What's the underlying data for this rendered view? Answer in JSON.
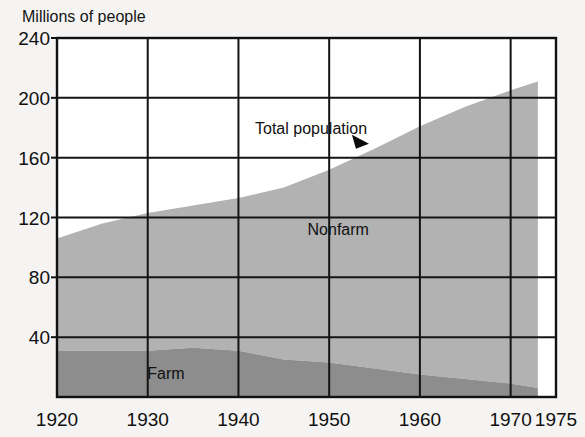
{
  "chart_data": {
    "type": "area",
    "stacked": true,
    "title": "",
    "subtitle": "",
    "ylabel": "Millions of people",
    "xlabel": "",
    "grid": true,
    "legend_position": "inline-annotation",
    "xlim": [
      1920,
      1975
    ],
    "ylim": [
      0,
      240
    ],
    "x_ticks": [
      1920,
      1930,
      1940,
      1950,
      1960,
      1970,
      1975
    ],
    "x_tick_labels": [
      "1920",
      "1930",
      "1940",
      "1950",
      "1960",
      "1970",
      "1975"
    ],
    "y_ticks": [
      40,
      80,
      120,
      160,
      200,
      240
    ],
    "y_tick_labels": [
      "40",
      "80",
      "120",
      "160",
      "200",
      "240"
    ],
    "data_end_year": 1973,
    "x": [
      1920,
      1925,
      1930,
      1935,
      1940,
      1945,
      1950,
      1955,
      1960,
      1965,
      1970,
      1973
    ],
    "series": [
      {
        "name": "Farm",
        "color": "#8d8d8d",
        "label": "Farm",
        "label_x": 1932,
        "label_y": 12,
        "values": [
          31,
          31,
          31,
          33,
          31,
          25,
          23,
          19,
          15,
          12,
          9,
          6
        ]
      },
      {
        "name": "Nonfarm",
        "color": "#b2b2b2",
        "label": "Nonfarm",
        "label_x": 1951,
        "label_y": 108,
        "values": [
          75,
          85,
          92,
          95,
          102,
          115,
          129,
          147,
          166,
          182,
          196,
          205
        ]
      }
    ],
    "totals": [
      106,
      116,
      123,
      128,
      133,
      140,
      152,
      166,
      181,
      194,
      205,
      211
    ],
    "annotations": [
      {
        "text": "Total population",
        "name": "total-population-annotation",
        "x": 1948,
        "y": 176,
        "pointer": {
          "x": 1953.5,
          "y": 170,
          "shape": "triangle-right"
        }
      }
    ],
    "axis_color": "#111111",
    "grid_color": "#141414",
    "background": "#f5f4f2"
  },
  "labels": {
    "unit_caption": "Millions of people"
  }
}
